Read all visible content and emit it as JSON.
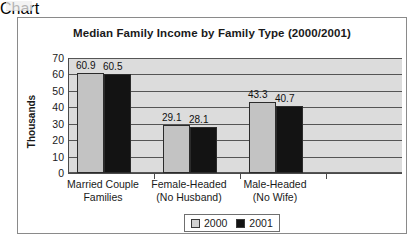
{
  "chart_data": {
    "type": "bar",
    "title": "Median Family Income by Family Type (2000/2001)",
    "xlabel": "",
    "ylabel": "Thousands",
    "ylim": [
      0,
      70
    ],
    "ytick_step": 10,
    "yticks": [
      "70",
      "60",
      "50",
      "40",
      "30",
      "20",
      "10",
      "0"
    ],
    "grid": true,
    "legend_position": "bottom",
    "categories": [
      {
        "line1": "Married Couple",
        "line2": "Families"
      },
      {
        "line1": "Female-Headed",
        "line2": "(No Husband)"
      },
      {
        "line1": "Male-Headed",
        "line2": "(No Wife)"
      }
    ],
    "series": [
      {
        "name": "2000",
        "color": "#c3c3c3",
        "values": [
          60.9,
          29.1,
          43.3
        ]
      },
      {
        "name": "2001",
        "color": "#131313",
        "values": [
          60.5,
          28.1,
          40.7
        ]
      }
    ],
    "data_labels": [
      [
        "60.9",
        "60.5"
      ],
      [
        "29.1",
        "28.1"
      ],
      [
        "43.3",
        "40.7"
      ]
    ]
  },
  "legend": {
    "items": [
      {
        "label": "2000"
      },
      {
        "label": "2001"
      }
    ]
  }
}
